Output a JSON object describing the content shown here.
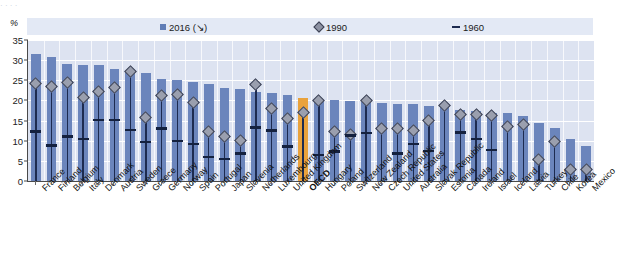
{
  "title_strip": "    ·   ·    ·     ·",
  "axis": {
    "y_label": "%",
    "y_ticks": [
      "35",
      "30",
      "25",
      "20",
      "15",
      "10",
      "5",
      "0"
    ],
    "y_min": 0,
    "y_max": 35
  },
  "legend": [
    {
      "label": "2016 (↘)",
      "marker": "square-marker"
    },
    {
      "label": "1990",
      "marker": "diamond-marker"
    },
    {
      "label": "1960",
      "marker": "dash-marker"
    }
  ],
  "colors": {
    "bar": "#6b85bc",
    "highlight_bar": "#e9a23c",
    "diamond": "#9a9fae",
    "dash": "#14213f",
    "plot_background": "#dde3f1",
    "legend_background": "#e3e9f5"
  },
  "chart_data": {
    "type": "bar",
    "title": "",
    "xlabel": "",
    "ylabel": "%",
    "ylim": [
      0,
      35
    ],
    "grid": true,
    "legend_position": "top",
    "highlight_category": "OECD",
    "categories": [
      "France",
      "Finland",
      "Belgium",
      "Italy",
      "Denmark",
      "Austria",
      "Sweden",
      "Greece",
      "Germany",
      "Norway",
      "Spain",
      "Portugal",
      "Japan",
      "Slovenia",
      "Netherlands",
      "Luxembourg",
      "United Kingdom",
      "OECD",
      "Hungary",
      "Poland",
      "Switzerland",
      "New Zealand",
      "Czech Republic",
      "United States",
      "Australia",
      "Slovak Republic",
      "Estonia",
      "Canada",
      "Ireland",
      "Israel",
      "Iceland",
      "Latvia",
      "Turkey",
      "Chile",
      "Korea",
      "Mexico"
    ],
    "series": [
      {
        "name": "2016 (↘)",
        "type": "bar",
        "values": [
          31.5,
          30.8,
          29.0,
          28.9,
          28.7,
          27.8,
          27.2,
          26.9,
          25.3,
          25.1,
          24.7,
          24.1,
          23.0,
          22.8,
          22.2,
          21.8,
          21.3,
          20.7,
          20.2,
          20.0,
          19.8,
          19.5,
          19.3,
          19.1,
          19.0,
          18.7,
          18.5,
          17.6,
          17.3,
          17.0,
          16.8,
          16.2,
          14.3,
          13.2,
          10.5,
          8.6
        ]
      },
      {
        "name": "1990",
        "type": "scatter",
        "marker": "diamond",
        "values": [
          24.3,
          23.5,
          24.4,
          20.8,
          22.1,
          23.1,
          27.2,
          15.7,
          21.3,
          21.5,
          19.4,
          12.2,
          11.0,
          10.0,
          24.0,
          18.0,
          15.5,
          17.0,
          20.0,
          12.3,
          11.5,
          20.1,
          13.1,
          13.0,
          12.5,
          15.0,
          18.7,
          16.6,
          16.5,
          16.3,
          13.6,
          14.0,
          5.3,
          9.9,
          2.8,
          2.9
        ]
      },
      {
        "name": "1960",
        "type": "scatter",
        "marker": "dash",
        "values": [
          12.3,
          8.8,
          11.0,
          10.5,
          15.1,
          15.1,
          12.6,
          9.7,
          13.0,
          10.0,
          9.2,
          6.0,
          5.5,
          6.8,
          13.3,
          12.5,
          8.6,
          null,
          6.5,
          7.3,
          11.3,
          11.9,
          null,
          6.8,
          9.2,
          7.5,
          null,
          12.0,
          10.5,
          7.7,
          null,
          null,
          null,
          null,
          null,
          null
        ]
      }
    ]
  }
}
